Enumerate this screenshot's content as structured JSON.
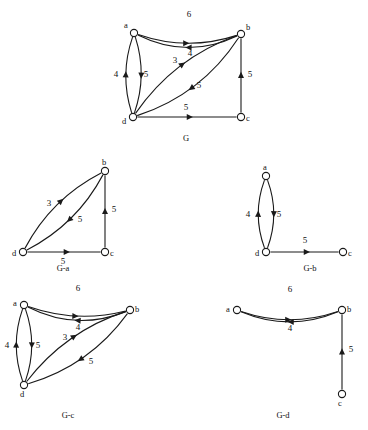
{
  "figure": {
    "background_color": "#ffffff",
    "stroke_color": "#1a1a1a",
    "text_color": "#111111"
  },
  "graphs": [
    {
      "id": "G",
      "caption": "G",
      "caption_pos": {
        "x": 186,
        "y": 141
      },
      "nodes": [
        {
          "id": "a",
          "label": "a",
          "x": 134,
          "y": 33,
          "r": 3.6,
          "label_dx": -8,
          "label_dy": -5
        },
        {
          "id": "b",
          "label": "b",
          "x": 241,
          "y": 34,
          "r": 3.6,
          "label_dx": 7,
          "label_dy": -4
        },
        {
          "id": "c",
          "label": "c",
          "x": 241,
          "y": 117,
          "r": 3.6,
          "label_dx": 7,
          "label_dy": 4
        },
        {
          "id": "d",
          "label": "d",
          "x": 133,
          "y": 117,
          "r": 3.6,
          "label_dx": -9,
          "label_dy": 7
        }
      ],
      "edges": [
        {
          "from": "b",
          "to": "a",
          "weight": "6",
          "curve": -13,
          "label_pos": {
            "x": 189,
            "y": 17
          },
          "arrow_t": 0.52
        },
        {
          "from": "a",
          "to": "b",
          "weight": "4",
          "curve": 9,
          "label_pos": {
            "x": 190,
            "y": 56
          },
          "arrow_t": 0.52
        },
        {
          "from": "d",
          "to": "b",
          "weight": "3",
          "curve": -11,
          "label_pos": {
            "x": 175,
            "y": 63
          },
          "arrow_t": 0.55
        },
        {
          "from": "b",
          "to": "d",
          "weight": "5",
          "curve": -12,
          "label_pos": {
            "x": 199,
            "y": 88
          },
          "arrow_t": 0.56
        },
        {
          "from": "a",
          "to": "d",
          "weight": "4",
          "curve": -7,
          "label_pos": {
            "x": 116,
            "y": 77
          },
          "arrow_t": 0.55
        },
        {
          "from": "d",
          "to": "a",
          "weight": "5",
          "curve": -7,
          "label_pos": {
            "x": 146,
            "y": 77
          },
          "arrow_t": 0.55
        },
        {
          "from": "c",
          "to": "b",
          "weight": "5",
          "curve": 0,
          "label_pos": {
            "x": 250,
            "y": 77
          },
          "arrow_t": 0.55
        },
        {
          "from": "d",
          "to": "c",
          "weight": "5",
          "curve": 0,
          "label_pos": {
            "x": 186,
            "y": 110
          },
          "arrow_t": 0.56
        }
      ]
    },
    {
      "id": "G-a",
      "caption": "G-a",
      "caption_pos": {
        "x": 63,
        "y": 271
      },
      "nodes": [
        {
          "id": "b",
          "label": "b",
          "x": 105,
          "y": 171,
          "r": 3.6,
          "label_dx": -1,
          "label_dy": -6
        },
        {
          "id": "c",
          "label": "c",
          "x": 105,
          "y": 252,
          "r": 3.6,
          "label_dx": 7,
          "label_dy": 4
        },
        {
          "id": "d",
          "label": "d",
          "x": 23,
          "y": 252,
          "r": 3.6,
          "label_dx": -9,
          "label_dy": 4
        }
      ],
      "edges": [
        {
          "from": "d",
          "to": "b",
          "weight": "3",
          "curve": -9,
          "label_pos": {
            "x": 49,
            "y": 206
          },
          "arrow_t": 0.58
        },
        {
          "from": "b",
          "to": "d",
          "weight": "5",
          "curve": -9,
          "label_pos": {
            "x": 80,
            "y": 222
          },
          "arrow_t": 0.55
        },
        {
          "from": "c",
          "to": "b",
          "weight": "5",
          "curve": 0,
          "label_pos": {
            "x": 114,
            "y": 212
          },
          "arrow_t": 0.55
        },
        {
          "from": "d",
          "to": "c",
          "weight": "5",
          "curve": 0,
          "label_pos": {
            "x": 63,
            "y": 264
          },
          "arrow_t": 0.58
        }
      ]
    },
    {
      "id": "G-b",
      "caption": "G-b",
      "caption_pos": {
        "x": 310,
        "y": 271
      },
      "nodes": [
        {
          "id": "a",
          "label": "a",
          "x": 266,
          "y": 176,
          "r": 3.6,
          "label_dx": -1,
          "label_dy": -6
        },
        {
          "id": "d",
          "label": "d",
          "x": 266,
          "y": 252,
          "r": 3.6,
          "label_dx": -9,
          "label_dy": 4
        },
        {
          "id": "c",
          "label": "c",
          "x": 343,
          "y": 252,
          "r": 3.6,
          "label_dx": 7,
          "label_dy": 4
        }
      ],
      "edges": [
        {
          "from": "a",
          "to": "d",
          "weight": "4",
          "curve": -7,
          "label_pos": {
            "x": 248,
            "y": 217
          },
          "arrow_t": 0.55
        },
        {
          "from": "d",
          "to": "a",
          "weight": "5",
          "curve": -7,
          "label_pos": {
            "x": 279,
            "y": 217
          },
          "arrow_t": 0.55
        },
        {
          "from": "d",
          "to": "c",
          "weight": "5",
          "curve": 0,
          "label_pos": {
            "x": 305,
            "y": 243
          },
          "arrow_t": 0.58
        }
      ]
    },
    {
      "id": "G-c",
      "caption": "G-c",
      "caption_pos": {
        "x": 68,
        "y": 418
      },
      "nodes": [
        {
          "id": "a",
          "label": "a",
          "x": 24,
          "y": 305,
          "r": 3.6,
          "label_dx": -9,
          "label_dy": 1
        },
        {
          "id": "b",
          "label": "b",
          "x": 130,
          "y": 310,
          "r": 3.6,
          "label_dx": 7,
          "label_dy": 2
        },
        {
          "id": "d",
          "label": "d",
          "x": 24,
          "y": 385,
          "r": 3.6,
          "label_dx": -2,
          "label_dy": 12
        }
      ],
      "edges": [
        {
          "from": "b",
          "to": "a",
          "weight": "6",
          "curve": -12,
          "label_pos": {
            "x": 78,
            "y": 291
          },
          "arrow_t": 0.52
        },
        {
          "from": "a",
          "to": "b",
          "weight": "4",
          "curve": 8,
          "label_pos": {
            "x": 78,
            "y": 330
          },
          "arrow_t": 0.52
        },
        {
          "from": "d",
          "to": "b",
          "weight": "3",
          "curve": -10,
          "label_pos": {
            "x": 65,
            "y": 340
          },
          "arrow_t": 0.56
        },
        {
          "from": "b",
          "to": "d",
          "weight": "5",
          "curve": -11,
          "label_pos": {
            "x": 91,
            "y": 364
          },
          "arrow_t": 0.56
        },
        {
          "from": "a",
          "to": "d",
          "weight": "4",
          "curve": -7,
          "label_pos": {
            "x": 7,
            "y": 348
          },
          "arrow_t": 0.55
        },
        {
          "from": "d",
          "to": "a",
          "weight": "5",
          "curve": -7,
          "label_pos": {
            "x": 38,
            "y": 348
          },
          "arrow_t": 0.55
        }
      ]
    },
    {
      "id": "G-d",
      "caption": "G-d",
      "caption_pos": {
        "x": 283,
        "y": 418
      },
      "nodes": [
        {
          "id": "a",
          "label": "a",
          "x": 237,
          "y": 310,
          "r": 3.6,
          "label_dx": -9,
          "label_dy": 2
        },
        {
          "id": "b",
          "label": "b",
          "x": 342,
          "y": 310,
          "r": 3.6,
          "label_dx": 7,
          "label_dy": 2
        },
        {
          "id": "c",
          "label": "c",
          "x": 342,
          "y": 394,
          "r": 3.6,
          "label_dx": -2,
          "label_dy": 12
        }
      ],
      "edges": [
        {
          "from": "b",
          "to": "a",
          "weight": "6",
          "curve": -11,
          "label_pos": {
            "x": 290,
            "y": 292
          },
          "arrow_t": 0.52
        },
        {
          "from": "a",
          "to": "b",
          "weight": "4",
          "curve": 9,
          "label_pos": {
            "x": 290,
            "y": 331
          },
          "arrow_t": 0.52
        },
        {
          "from": "c",
          "to": "b",
          "weight": "5",
          "curve": 0,
          "label_pos": {
            "x": 351,
            "y": 352
          },
          "arrow_t": 0.55
        }
      ]
    }
  ]
}
